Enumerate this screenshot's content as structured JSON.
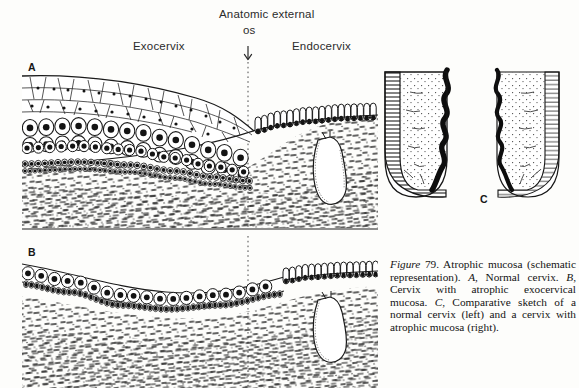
{
  "figure": {
    "number": "79",
    "figure_word": "Figure",
    "title": "Atrophic mucosa",
    "caption_full": "Figure 79. Atrophic mucosa (schematic representation). A, Normal cervix. B, Cervix with atrophic exocervical mucosa. C, Comparative sketch of a normal cervix (left) and a cervix with atrophic mucosa (right).",
    "caption_segments": {
      "s1": " 79.  Atrophic mucosa (schematic representation). ",
      "a_letter": "A",
      "s2": ", Normal cervix. ",
      "b_letter": "B",
      "s3": ", Cervix with atrophic exocervical mucosa. ",
      "c_letter": "C",
      "s4": ", Comparative sketch of a normal cervix (left) and a cervix with atrophic mucosa (right)."
    }
  },
  "annotations": {
    "anatomic_os_line1": "Anatomic external",
    "anatomic_os_line2": "os",
    "exocervix": "Exocervix",
    "endocervix": "Endocervix",
    "arrow_glyph": "↓"
  },
  "panels": [
    {
      "letter": "A",
      "name": "normal-cervix-histology",
      "description": "Normal cervix: thick stratified squamous exocervical epithelium meeting columnar endocervical epithelium at the anatomic external os, with an endocervical gland cleft in the stroma.",
      "epithelium_layers": [
        "superficial-squamous",
        "intermediate",
        "parabasal",
        "basal"
      ],
      "layer_count": 4
    },
    {
      "letter": "B",
      "name": "atrophic-exocervical-mucosa-histology",
      "description": "Cervix with atrophic exocervical mucosa: thin two-to-three cell layer epithelium over stroma, columnar endocervical epithelium to the right of the os.",
      "epithelium_layers": [
        "parabasal",
        "basal"
      ],
      "layer_count": 2
    },
    {
      "letter": "C",
      "name": "comparative-cervix-sketch",
      "description": "Comparative sketch: normal cervix on the left with thick mucosal band, atrophic cervix on the right with thin mucosal band; endocervical canal shown as a dark wavy channel between the halves.",
      "left_half": "normal cervix",
      "right_half": "cervix with atrophic mucosa"
    }
  ],
  "colors": {
    "ink": "#1a1a1a",
    "paper": "#fdfdfb",
    "mucosa_band_dark": "#1c1c1c",
    "stroma_stipple": "#2a2a2a",
    "canal_black": "#0d0d0d"
  }
}
